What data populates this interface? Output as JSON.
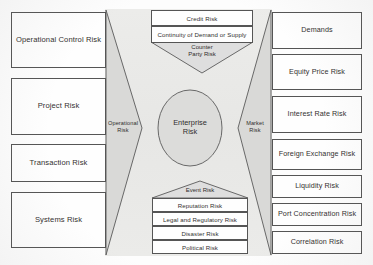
{
  "diagram": {
    "title": "Enterprise Risk",
    "center": {
      "label_line1": "Enterprise",
      "label_line2": "Risk"
    },
    "wedges": {
      "left": {
        "label_line1": "Operational",
        "label_line2": "Risk"
      },
      "right": {
        "label_line1": "Market",
        "label_line2": "Risk"
      }
    },
    "top_group": {
      "tip_label_line1": "Counter",
      "tip_label_line2": "Party Risk",
      "rows": [
        "Credit Risk",
        "Continuity of Demand or Supply"
      ]
    },
    "bottom_group": {
      "tip_label": "Event Risk",
      "rows": [
        "Reputation Risk",
        "Legal and Regulatory Risk",
        "Disaster Risk",
        "Political Risk"
      ]
    },
    "left_column": [
      "Operational Control Risk",
      "Project Risk",
      "Transaction Risk",
      "Systems Risk"
    ],
    "right_column": [
      "Demands",
      "Equity Price Risk",
      "Interest Rate Risk",
      "Foreign Exchange Risk",
      "Liquidity Risk",
      "Port Concentration Risk",
      "Correlation Risk"
    ],
    "colors": {
      "panel_fill": "#e9e9e7",
      "wedge_fill": "#d8d8d6",
      "ellipse_fill": "#dcdcda",
      "box_fill": "#fefefe",
      "stroke": "#555555",
      "text": "#33302f"
    }
  }
}
